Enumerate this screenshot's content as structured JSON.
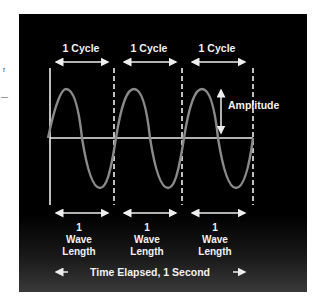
{
  "diagram": {
    "cycle_labels": [
      "1 Cycle",
      "1 Cycle",
      "1 Cycle"
    ],
    "amplitude_label": "Amplitude",
    "wavelength_labels": [
      {
        "line1": "1",
        "line2": "Wave",
        "line3": "Length"
      },
      {
        "line1": "1",
        "line2": "Wave",
        "line3": "Length"
      },
      {
        "line1": "1",
        "line2": "Wave",
        "line3": "Length"
      }
    ],
    "time_label": "Time Elapsed, 1 Second",
    "colors": {
      "background": "#000000",
      "wave": "#8a8a8a",
      "lines": "#eeeeee",
      "text": "#f2f2f2"
    }
  },
  "margin_marks": [
    "r",
    "—"
  ]
}
